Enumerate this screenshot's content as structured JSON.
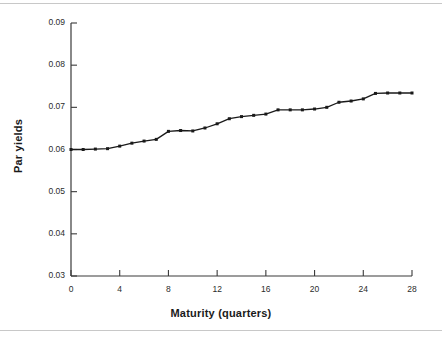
{
  "figure": {
    "background_color": "#ffffff",
    "rule_color": "#c8c8c8",
    "line_color": "#1a1a1a",
    "marker_color": "#1a1a1a",
    "axis_color": "#3a3a3a"
  },
  "chart_data": {
    "type": "line",
    "title": "",
    "xlabel": "Maturity (quarters)",
    "ylabel": "Par yields",
    "xlim": [
      0,
      28
    ],
    "ylim": [
      0.03,
      0.09
    ],
    "xticks": [
      0,
      4,
      8,
      12,
      16,
      20,
      24,
      28
    ],
    "xtick_labels": [
      "0",
      "4",
      "8",
      "12",
      "16",
      "20",
      "24",
      "28"
    ],
    "yticks": [
      0.03,
      0.04,
      0.05,
      0.06,
      0.07,
      0.08,
      0.09
    ],
    "ytick_labels": [
      "0.03",
      "0.04",
      "0.05",
      "0.06",
      "0.07",
      "0.08",
      "0.09"
    ],
    "grid": false,
    "legend": "none",
    "marker": "square",
    "x": [
      0,
      1,
      2,
      3,
      4,
      5,
      6,
      7,
      8,
      9,
      10,
      11,
      12,
      13,
      14,
      15,
      16,
      17,
      18,
      19,
      20,
      21,
      22,
      23,
      24,
      25,
      26,
      27,
      28
    ],
    "values": [
      0.06,
      0.06,
      0.0601,
      0.0602,
      0.0608,
      0.0615,
      0.062,
      0.0624,
      0.0643,
      0.0645,
      0.0644,
      0.0651,
      0.0661,
      0.0673,
      0.0678,
      0.0681,
      0.0684,
      0.0694,
      0.0694,
      0.0694,
      0.0696,
      0.07,
      0.0712,
      0.0715,
      0.072,
      0.0733,
      0.0734,
      0.0734,
      0.0734
    ],
    "series": [
      {
        "name": "Par yields",
        "values": [
          0.06,
          0.06,
          0.0601,
          0.0602,
          0.0608,
          0.0615,
          0.062,
          0.0624,
          0.0643,
          0.0645,
          0.0644,
          0.0651,
          0.0661,
          0.0673,
          0.0678,
          0.0681,
          0.0684,
          0.0694,
          0.0694,
          0.0694,
          0.0696,
          0.07,
          0.0712,
          0.0715,
          0.072,
          0.0733,
          0.0734,
          0.0734,
          0.0734
        ]
      }
    ]
  }
}
